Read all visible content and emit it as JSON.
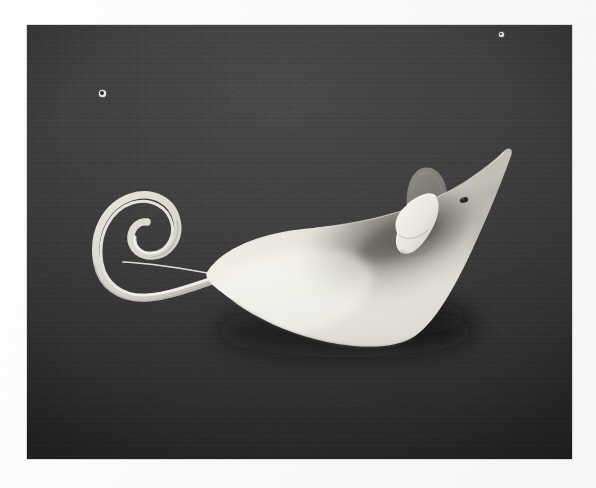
{
  "page": {
    "medium": "black-and-white photographic print",
    "background_color": "#ffffff",
    "margin_color": "#fbfbfa"
  },
  "photo": {
    "name": "paper-mouse-photo",
    "frame": {
      "x": 27,
      "y": 25,
      "width": 545,
      "height": 434
    },
    "backdrop": {
      "description": "dark textured cloth backdrop",
      "color_top": "#484848",
      "color_mid": "#3b3b3b",
      "color_bottom": "#232323",
      "texture": "woven-linen"
    },
    "subject": {
      "name": "paper-mouse-sculpture",
      "description": "white paper cone formed into a mouse with curled spiral tail and two ears",
      "material": "white card stock",
      "body_color": "#eceae3",
      "shadow_color": "#6f6c66",
      "ear_front_color": "#e9e7e0",
      "ear_back_color": "#7e7c77",
      "eye_color": "#2a2a28",
      "tail_color": "#dedbd3",
      "orientation": "nose pointing upper-right, tail curling to the left"
    },
    "artifacts": [
      {
        "name": "dust-spot-upper-left",
        "x": 102,
        "y": 93,
        "size": 7
      },
      {
        "name": "dust-spot-upper-right",
        "x": 501,
        "y": 34,
        "size": 5
      }
    ]
  }
}
